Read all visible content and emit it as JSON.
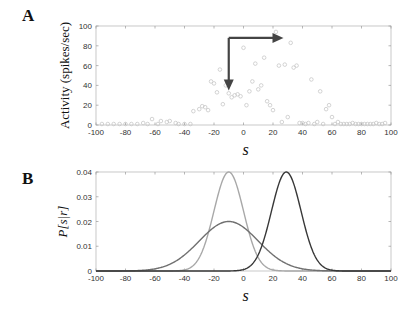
{
  "panels": {
    "a": {
      "label": "A"
    },
    "b": {
      "label": "B"
    }
  },
  "chart_data": [
    {
      "type": "scatter",
      "panel": "A",
      "title": "",
      "xlabel": "s",
      "ylabel": "Activity (spikes/sec)",
      "xlim": [
        -100,
        100
      ],
      "ylim": [
        0,
        100
      ],
      "xticks": [
        -100,
        -80,
        -60,
        -40,
        -20,
        0,
        20,
        40,
        60,
        80,
        100
      ],
      "yticks": [
        0,
        20,
        40,
        60,
        80,
        100
      ],
      "grid": false,
      "marker": "open-circle",
      "marker_color": "#c8c8c8",
      "points": [
        [
          -96,
          1
        ],
        [
          -92,
          1
        ],
        [
          -88,
          1
        ],
        [
          -84,
          1
        ],
        [
          -80,
          1
        ],
        [
          -76,
          1
        ],
        [
          -72,
          1
        ],
        [
          -68,
          2
        ],
        [
          -65,
          1
        ],
        [
          -62,
          6
        ],
        [
          -58,
          1
        ],
        [
          -56,
          4
        ],
        [
          -52,
          3
        ],
        [
          -50,
          4
        ],
        [
          -46,
          2
        ],
        [
          -44,
          1
        ],
        [
          -40,
          1
        ],
        [
          -36,
          1
        ],
        [
          -34,
          14
        ],
        [
          -30,
          16
        ],
        [
          -28,
          19
        ],
        [
          -26,
          18
        ],
        [
          -24,
          15
        ],
        [
          -22,
          44
        ],
        [
          -20,
          42
        ],
        [
          -18,
          33
        ],
        [
          -16,
          56
        ],
        [
          -14,
          21
        ],
        [
          -12,
          40
        ],
        [
          -10,
          32
        ],
        [
          -8,
          28
        ],
        [
          -6,
          30
        ],
        [
          -4,
          31
        ],
        [
          -2,
          29
        ],
        [
          0,
          78
        ],
        [
          2,
          20
        ],
        [
          4,
          34
        ],
        [
          6,
          44
        ],
        [
          8,
          62
        ],
        [
          10,
          36
        ],
        [
          12,
          40
        ],
        [
          14,
          68
        ],
        [
          16,
          24
        ],
        [
          18,
          20
        ],
        [
          20,
          15
        ],
        [
          22,
          94
        ],
        [
          24,
          60
        ],
        [
          26,
          3
        ],
        [
          28,
          61
        ],
        [
          30,
          8
        ],
        [
          32,
          83
        ],
        [
          34,
          58
        ],
        [
          36,
          60
        ],
        [
          38,
          2
        ],
        [
          40,
          2
        ],
        [
          42,
          1
        ],
        [
          44,
          2
        ],
        [
          46,
          46
        ],
        [
          48,
          1
        ],
        [
          50,
          3
        ],
        [
          52,
          34
        ],
        [
          54,
          1
        ],
        [
          56,
          16
        ],
        [
          58,
          20
        ],
        [
          60,
          8
        ],
        [
          62,
          1
        ],
        [
          64,
          3
        ],
        [
          66,
          1
        ],
        [
          68,
          1
        ],
        [
          70,
          1
        ],
        [
          72,
          1
        ],
        [
          74,
          2
        ],
        [
          76,
          1
        ],
        [
          78,
          1
        ],
        [
          80,
          1
        ],
        [
          82,
          1
        ],
        [
          84,
          1
        ],
        [
          86,
          1
        ],
        [
          88,
          1
        ],
        [
          90,
          2
        ],
        [
          92,
          1
        ],
        [
          94,
          1
        ],
        [
          96,
          2
        ]
      ],
      "annotations": [
        {
          "type": "arrow",
          "from": [
            -10,
            88
          ],
          "to": [
            21,
            88
          ],
          "direction": "right",
          "color": "#444444"
        },
        {
          "type": "arrow",
          "from": [
            -10,
            88
          ],
          "to": [
            -10,
            44
          ],
          "direction": "down",
          "color": "#444444"
        }
      ]
    },
    {
      "type": "line",
      "panel": "B",
      "title": "",
      "xlabel": "s",
      "ylabel": "P[s|r]",
      "xlim": [
        -100,
        100
      ],
      "ylim": [
        0,
        0.04
      ],
      "xticks": [
        -100,
        -80,
        -60,
        -40,
        -20,
        0,
        20,
        40,
        60,
        80,
        100
      ],
      "yticks": [
        0,
        0.01,
        0.02,
        0.03,
        0.04
      ],
      "ytick_labels": [
        "0",
        "0.01",
        "0.02",
        "0.03",
        "0.04"
      ],
      "grid": false,
      "series": [
        {
          "name": "narrow-gaussian-light",
          "mean": -10,
          "sd": 10,
          "peak": 0.04,
          "color": "#a8a8a8"
        },
        {
          "name": "wide-gaussian-medium",
          "mean": -10,
          "sd": 20,
          "peak": 0.02,
          "color": "#707070"
        },
        {
          "name": "narrow-gaussian-dark",
          "mean": 29,
          "sd": 10,
          "peak": 0.04,
          "color": "#383838"
        }
      ]
    }
  ]
}
